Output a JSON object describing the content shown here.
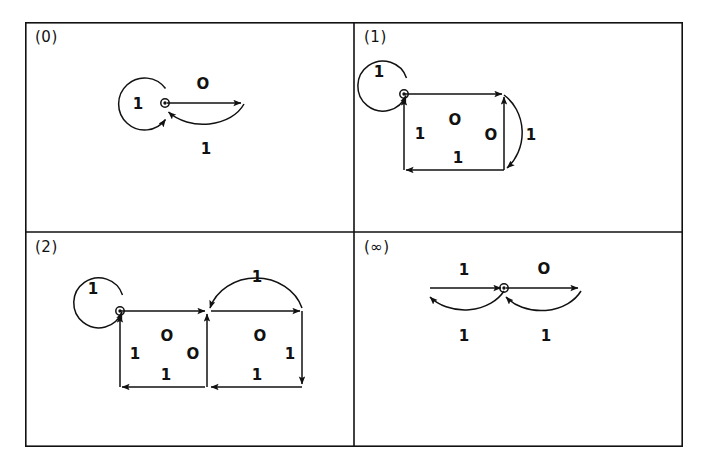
{
  "figure": {
    "name": "state-transition-diagram-grid",
    "border_color": "#111111",
    "background": "#ffffff",
    "panels": [
      {
        "id": "panel-0",
        "label": "(0)",
        "position": "top-left",
        "description": "single node with self loop and one arc pair",
        "node_count": 2,
        "edge_labels": [
          "1",
          "O",
          "1"
        ],
        "edges": [
          {
            "from": "q0",
            "to": "q0",
            "label": "1",
            "shape": "self-loop-left"
          },
          {
            "from": "q0",
            "to": "q1",
            "label": "O",
            "shape": "straight-right"
          },
          {
            "from": "q1",
            "to": "q0",
            "label": "1",
            "shape": "arc-below"
          }
        ]
      },
      {
        "id": "panel-1",
        "label": "(1)",
        "position": "top-right",
        "description": "square cycle with self loop and right return arc",
        "node_count": 4,
        "edge_labels": [
          "1",
          "O",
          "1",
          "1",
          "O"
        ],
        "edges": [
          {
            "from": "q0",
            "to": "q0",
            "label": "1",
            "shape": "self-loop-left"
          },
          {
            "from": "q0",
            "to": "q1",
            "label": "O",
            "shape": "straight-right"
          },
          {
            "from": "q1",
            "to": "q2",
            "label": "1",
            "shape": "arc-right"
          },
          {
            "from": "q1",
            "to": "q3",
            "label": "O",
            "shape": "straight-down"
          },
          {
            "from": "q3",
            "to": "q4",
            "label": "1",
            "shape": "straight-left"
          },
          {
            "from": "q4",
            "to": "q0",
            "label": "1",
            "shape": "straight-up"
          }
        ]
      },
      {
        "id": "panel-2",
        "label": "(2)",
        "position": "bottom-left",
        "description": "two squares with self loop and arc over right square",
        "node_count": 6,
        "edge_labels": [
          "1",
          "O",
          "1",
          "O",
          "O",
          "1",
          "1",
          "1"
        ],
        "edges": [
          {
            "from": "q0",
            "to": "q0",
            "label": "1",
            "shape": "self-loop-left"
          },
          {
            "from": "q0",
            "to": "q1",
            "label": "O",
            "shape": "straight-right"
          },
          {
            "from": "q1",
            "to": "q2",
            "label": "O",
            "shape": "straight-right"
          },
          {
            "from": "q2",
            "to": "q1",
            "label": "1",
            "shape": "arc-above"
          },
          {
            "from": "q1",
            "to": "q4",
            "label": "O",
            "shape": "straight-down"
          },
          {
            "from": "q2",
            "to": "q5",
            "label": "1",
            "shape": "straight-down"
          },
          {
            "from": "q5",
            "to": "q4",
            "label": "1",
            "shape": "straight-left"
          },
          {
            "from": "q4",
            "to": "q3",
            "label": "1",
            "shape": "straight-left"
          },
          {
            "from": "q3",
            "to": "q0",
            "label": "1",
            "shape": "straight-up"
          }
        ]
      },
      {
        "id": "panel-infinity",
        "label": "(∞)",
        "position": "bottom-right",
        "description": "central node with two lens shaped cycles left and right",
        "node_count": 3,
        "edge_labels": [
          "1",
          "O",
          "1",
          "1"
        ],
        "edges": [
          {
            "from": "qL",
            "to": "q0",
            "label": "1",
            "shape": "straight-right"
          },
          {
            "from": "q0",
            "to": "qL",
            "label": "1",
            "shape": "arc-below-left"
          },
          {
            "from": "q0",
            "to": "qR",
            "label": "O",
            "shape": "straight-right"
          },
          {
            "from": "qR",
            "to": "q0",
            "label": "1",
            "shape": "arc-below-right"
          }
        ]
      }
    ],
    "symbols": {
      "one": "1",
      "zero": "O",
      "infinity": "∞"
    }
  }
}
